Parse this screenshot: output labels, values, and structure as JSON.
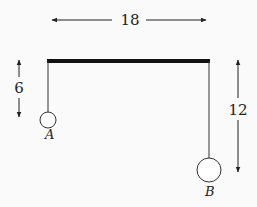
{
  "diagram": {
    "dimensions": {
      "beam_length": "18",
      "string_A_length": "6",
      "string_B_length": "12"
    },
    "labels": {
      "mass_a": "A",
      "mass_b": "B"
    },
    "colors": {
      "beam": "#111111",
      "line": "#333333",
      "background": "#fafafa"
    }
  }
}
